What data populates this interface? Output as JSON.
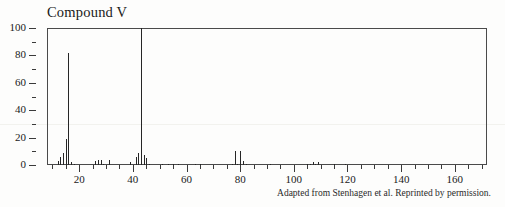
{
  "figure": {
    "title": "Compound V",
    "attribution": "Adapted from Stenhagen et al. Reprinted by permission."
  },
  "chart_data": {
    "type": "bar",
    "title": "Compound V",
    "subtitle": "",
    "xlabel": "",
    "ylabel": "",
    "xlim": [
      8,
      172
    ],
    "ylim": [
      0,
      100
    ],
    "grid": false,
    "legend": null,
    "annotations": [
      "Adapted from Stenhagen et al. Reprinted by permission."
    ],
    "x_ticks_major": [
      20,
      40,
      60,
      80,
      100,
      120,
      140,
      160
    ],
    "x_tick_labels": [
      "20",
      "40",
      "60",
      "80",
      "100",
      "120",
      "140",
      "160"
    ],
    "x_tick_minor_step": 5,
    "y_ticks_major": [
      0,
      20,
      40,
      60,
      80,
      100
    ],
    "y_tick_labels": [
      "0",
      "20",
      "40",
      "60",
      "80",
      "100"
    ],
    "y_tick_minor_step": 10,
    "series": [
      {
        "name": "relative abundance",
        "x": [
          12,
          13,
          14,
          15,
          16,
          17,
          18,
          26,
          27,
          28,
          29,
          31,
          39,
          41,
          42,
          43,
          44,
          45,
          46,
          51,
          53,
          55,
          57,
          63,
          65,
          77,
          78,
          79,
          80,
          81,
          82,
          91,
          105,
          106,
          107,
          108,
          109,
          115,
          119
        ],
        "values": [
          3,
          6,
          9,
          19,
          82,
          2,
          1,
          3,
          4,
          4,
          1,
          4,
          2,
          6,
          9,
          100,
          7,
          5,
          1,
          1,
          1,
          1,
          1,
          1,
          1,
          1,
          10,
          1,
          10,
          3,
          1,
          1,
          1,
          1,
          2,
          1,
          2,
          1,
          1
        ]
      }
    ],
    "base_peak": {
      "mz": 43,
      "intensity": 100
    },
    "second_peak": {
      "mz": 16,
      "intensity": 82
    }
  },
  "axes": {
    "y_labels": [
      "100",
      "80",
      "60",
      "40",
      "20",
      "0"
    ],
    "x_labels": [
      "20",
      "40",
      "60",
      "80",
      "100",
      "120",
      "140",
      "160"
    ]
  }
}
